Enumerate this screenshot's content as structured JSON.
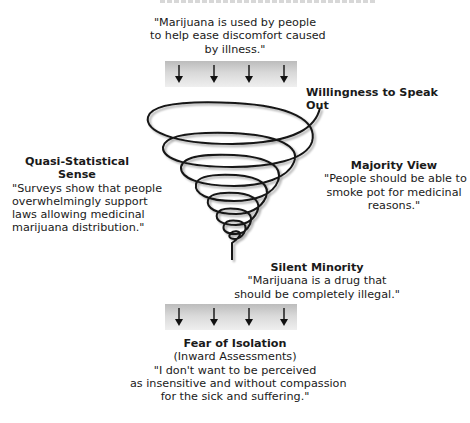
{
  "top_quote": {
    "lines": [
      "\"Marijuana is used by people",
      "to help ease discomfort caused",
      "by illness.\""
    ]
  },
  "top_pressure_bar": {
    "arrow_count": 4,
    "arrow_direction": "down"
  },
  "willingness": {
    "label": "Willingness to Speak Out"
  },
  "quasi_statistical": {
    "title": "Quasi-Statistical Sense",
    "lines": [
      "\"Surveys show that people",
      "overwhelmingly support",
      "laws allowing medicinal",
      "marijuana distribution.\""
    ]
  },
  "majority_view": {
    "title": "Majority View",
    "lines": [
      "\"People should be able to",
      "smoke pot for medicinal",
      "reasons.\""
    ]
  },
  "silent_minority": {
    "title": "Silent Minority",
    "lines": [
      "\"Marijuana is a drug that",
      "should be completely illegal.\""
    ]
  },
  "bottom_pressure_bar": {
    "arrow_count": 4,
    "arrow_direction": "down"
  },
  "fear_of_isolation": {
    "title": "Fear of Isolation",
    "subtitle": "(Inward Assessments)",
    "lines": [
      "\"I don't want to be perceived",
      "as insensitive and without compassion",
      "for the sick and suffering.\""
    ]
  },
  "colors": {
    "ink": "#1a1a1a",
    "bar_dark": "#bcbcbc",
    "bar_light": "#efefef"
  }
}
